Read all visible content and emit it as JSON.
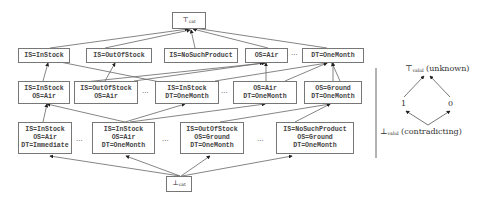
{
  "diagram": {
    "top": {
      "symbol": "⊤",
      "sub": "cat"
    },
    "bottom": {
      "symbol": "⊥",
      "sub": "cat"
    },
    "row1": [
      {
        "lines": [
          "IS=InStock"
        ]
      },
      {
        "lines": [
          "IS=OutOfStock"
        ]
      },
      {
        "lines": [
          "IS=NoSuchProduct"
        ]
      },
      {
        "lines": [
          "OS=Air"
        ]
      },
      {
        "lines": [
          "DT=OneMonth"
        ]
      }
    ],
    "row2": [
      {
        "lines": [
          "IS=InStock",
          "OS=Air"
        ]
      },
      {
        "lines": [
          "IS=OutOfStock",
          "OS=Air"
        ]
      },
      {
        "lines": [
          "IS=InStock",
          "DT=OneMonth"
        ]
      },
      {
        "lines": [
          "OS=Air",
          "DT=OneMonth"
        ]
      },
      {
        "lines": [
          "OS=Ground",
          "DT=OneMonth"
        ]
      }
    ],
    "row3": [
      {
        "lines": [
          "IS=InStock",
          "OS=Air",
          "DT=Immediate"
        ]
      },
      {
        "lines": [
          "IS=InStock",
          "OS=Air",
          "DT=OneMonth"
        ]
      },
      {
        "lines": [
          "IS=OutOfStock",
          "OS=Ground",
          "DT=OneMonth"
        ]
      },
      {
        "lines": [
          "IS=NoSuchProduct",
          "OS=Ground",
          "DT=OneMonth"
        ]
      }
    ],
    "ellipsis": "..."
  },
  "legend": {
    "top": {
      "symbol": "⊤",
      "sub": "valid",
      "label": "(unknown)"
    },
    "left": "1",
    "right": "0",
    "bottom": {
      "symbol": "⊥",
      "sub": "valid",
      "label": "(contradicting)"
    }
  }
}
